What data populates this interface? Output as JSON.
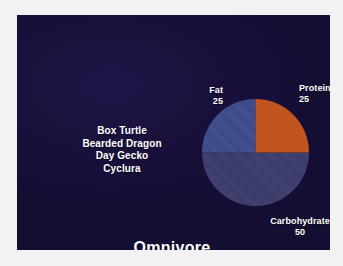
{
  "slide": {
    "title": "Omnivore",
    "background_color": "#1a1138",
    "frame_color": "#f2f2f4"
  },
  "species": {
    "items": [
      {
        "label": "Box Turtle"
      },
      {
        "label": "Bearded Dragon"
      },
      {
        "label": "Day Gecko"
      },
      {
        "label": "Cyclura"
      }
    ]
  },
  "chart_data": {
    "type": "pie",
    "title": "Omnivore",
    "subtitle": "",
    "labels": [
      "Protein",
      "Fat",
      "Carbohydrate"
    ],
    "values": [
      25,
      25,
      50
    ],
    "value_suffix": "",
    "colors": [
      "#c2551f",
      "#3c4a8c",
      "#3b3c6d"
    ],
    "slices": [
      {
        "name": "Protein",
        "value": 25,
        "color": "#c2551f",
        "start_angle": 0,
        "end_angle": 90,
        "label_position": "right"
      },
      {
        "name": "Fat",
        "value": 25,
        "color": "#3c4a8c",
        "start_angle": 270,
        "end_angle": 360,
        "label_position": "left"
      },
      {
        "name": "Carbohydrate",
        "value": 50,
        "color": "#3b3c6d",
        "start_angle": 90,
        "end_angle": 270,
        "label_position": "bottom"
      }
    ],
    "legend": "labels-on-chart",
    "grid": false,
    "xlabel": "",
    "ylabel": ""
  }
}
